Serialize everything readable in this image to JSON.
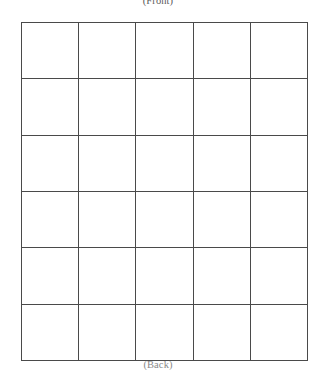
{
  "page": {
    "background_color": "#ffffff",
    "width": 316,
    "height": 368
  },
  "captions": {
    "top": "(Front)",
    "bottom": "(Back)"
  },
  "grid": {
    "columns": 5,
    "rows": 6,
    "border_color": "#4a4a4a",
    "cell_background": "#ffffff",
    "rows_data": [
      [
        "",
        "",
        "",
        "",
        ""
      ],
      [
        "",
        "",
        "",
        "",
        ""
      ],
      [
        "",
        "",
        "",
        "",
        ""
      ],
      [
        "",
        "",
        "",
        "",
        ""
      ],
      [
        "",
        "",
        "",
        "",
        ""
      ],
      [
        "",
        "",
        "",
        "",
        ""
      ]
    ]
  }
}
